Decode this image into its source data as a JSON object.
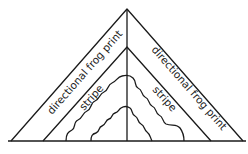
{
  "diagram": {
    "type": "triangle pattern layout",
    "labels": {
      "left_outer": "directional frog print",
      "right_outer": "directional frog print",
      "left_inner": "stripe",
      "right_inner": "stripe"
    },
    "colors": {
      "line": "#1a1a1a",
      "background": "#ffffff"
    }
  }
}
